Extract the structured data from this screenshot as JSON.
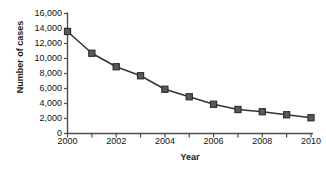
{
  "chart_data": {
    "type": "line",
    "title": "",
    "xlabel": "Year",
    "ylabel": "Number of cases",
    "x": [
      2000,
      2001,
      2002,
      2003,
      2004,
      2005,
      2006,
      2007,
      2008,
      2009,
      2010
    ],
    "values": [
      13600,
      10700,
      8900,
      7700,
      5900,
      4900,
      3900,
      3200,
      2900,
      2500,
      2100
    ],
    "series": [
      {
        "name": "Number of cases",
        "values": [
          13600,
          10700,
          8900,
          7700,
          5900,
          4900,
          3900,
          3200,
          2900,
          2500,
          2100
        ]
      }
    ],
    "xlim": [
      2000,
      2010
    ],
    "ylim": [
      0,
      16000
    ],
    "x_tick_values": [
      2000,
      2001,
      2002,
      2003,
      2004,
      2005,
      2006,
      2007,
      2008,
      2009,
      2010
    ],
    "x_tick_labels": [
      "2000",
      "",
      "2002",
      "",
      "2004",
      "",
      "2006",
      "",
      "2008",
      "",
      "2010"
    ],
    "y_tick_values": [
      0,
      2000,
      4000,
      6000,
      8000,
      10000,
      12000,
      14000,
      16000
    ],
    "y_tick_labels": [
      "0",
      "2,000",
      "4,000",
      "6,000",
      "8,000",
      "10,000",
      "12,000",
      "14,000",
      "16,000"
    ],
    "grid": false,
    "legend": false,
    "marker": "square",
    "line_color": "#333333",
    "marker_color": "#5a5a5a",
    "marker_edge_color": "#2b2b2b",
    "axis_color": "#4d4d4d",
    "background_color": "#ffffff"
  }
}
